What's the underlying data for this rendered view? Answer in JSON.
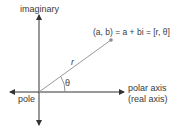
{
  "diagram": {
    "vertical_axis_label": "imaginary",
    "horizontal_axis_label_line1": "polar axis",
    "horizontal_axis_label_line2": "(real axis)",
    "origin_label": "pole",
    "point_label": "(a, b) = a + bi = [r, θ]",
    "radius_label": "r",
    "angle_label": "θ"
  },
  "colors": {
    "axis": "#333333",
    "ray": "#9a9a9a",
    "point": "#8a8a8a",
    "text": "#3a3a3a"
  }
}
